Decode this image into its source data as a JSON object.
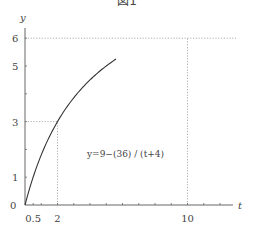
{
  "chart_data": {
    "type": "line",
    "title": "図1",
    "xlabel": "t",
    "ylabel": "y",
    "equation": "y=9−(36) / (t+4)",
    "x_ticks": [
      "0.5",
      "2",
      "10"
    ],
    "y_ticks": [
      "0",
      "1",
      "3",
      "5",
      "6"
    ],
    "origin_label": "0",
    "xlim": [
      0,
      12.8
    ],
    "ylim": [
      0,
      6.5
    ],
    "reference_lines": [
      {
        "type": "horizontal",
        "y": 6,
        "style": "dotted"
      },
      {
        "type": "vertical",
        "x": 10,
        "from_y": 0,
        "to_y": 6,
        "style": "dotted"
      },
      {
        "type": "horizontal",
        "y": 3,
        "from_x": 0,
        "to_x": 2,
        "style": "dotted"
      },
      {
        "type": "vertical",
        "x": 2,
        "from_y": 0,
        "to_y": 3,
        "style": "dotted"
      }
    ],
    "series": [
      {
        "name": "y=9-36/(t+4)",
        "x": [
          0,
          0.5,
          1,
          2,
          3,
          4,
          5,
          5.6
        ],
        "values": [
          0,
          1,
          1.8,
          3,
          3.86,
          4.5,
          5,
          5.25
        ]
      }
    ],
    "grid": false,
    "legend": "none"
  }
}
